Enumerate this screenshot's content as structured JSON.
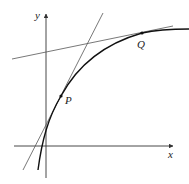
{
  "diagram": {
    "axes": {
      "x_label": "x",
      "y_label": "y",
      "color": "#333333"
    },
    "curve": {
      "description": "increasing concave curve (asymptotic)",
      "color": "#111111"
    },
    "points": [
      {
        "name": "P",
        "label": "P",
        "position": "lower, steep part of curve"
      },
      {
        "name": "Q",
        "label": "Q",
        "position": "upper, flattening part of curve"
      }
    ],
    "tangents": [
      {
        "at": "P",
        "description": "steep tangent line through P"
      },
      {
        "at": "Q",
        "description": "shallow tangent line through Q"
      }
    ],
    "line_color": "#555555"
  }
}
